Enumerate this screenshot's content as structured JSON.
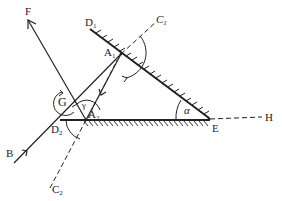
{
  "diagram": {
    "type": "optics-two-mirror-reflection",
    "colors": {
      "ink": "#222222",
      "background": "#ffffff"
    },
    "labels": {
      "F": "F",
      "B": "B",
      "G": "G",
      "D1": "D",
      "D1_sub": "1",
      "D2": "D",
      "D2_sub": "2",
      "A1": "A",
      "A1_sub": "1",
      "A2": "A",
      "A2_sub": "2",
      "C1": "C",
      "C1_sub": "1",
      "C2": "C",
      "C2_sub": "2",
      "E": "E",
      "H": "H",
      "alpha": "α",
      "gamma": "γ"
    }
  }
}
